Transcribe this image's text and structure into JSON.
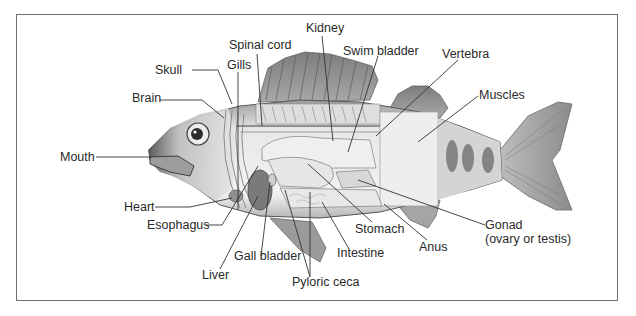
{
  "figure": {
    "labels": {
      "kidney": "Kidney",
      "spinal_cord": "Spinal cord",
      "swim_bladder": "Swim bladder",
      "vertebra": "Vertebra",
      "skull": "Skull",
      "gills": "Gills",
      "brain": "Brain",
      "muscles": "Muscles",
      "mouth": "Mouth",
      "heart": "Heart",
      "esophagus": "Esophagus",
      "liver": "Liver",
      "gall_bladder": "Gall bladder",
      "pyloric_ceca": "Pyloric ceca",
      "intestine": "Intestine",
      "stomach": "Stomach",
      "anus": "Anus",
      "gonad": "Gonad",
      "gonad_note": "(ovary or testis)"
    },
    "colors": {
      "frame": "#6e6e6e",
      "leader_line": "#333333",
      "fin": "#8a8a8a",
      "body": "#e6e6e6",
      "organ_dark": "#7a7a7a"
    }
  }
}
